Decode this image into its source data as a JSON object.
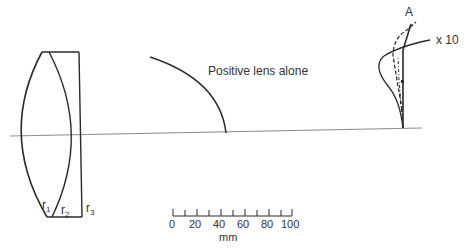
{
  "diagram": {
    "type": "optical lens aberration diagram",
    "lens": {
      "surfaces": [
        {
          "label": "r",
          "sub": "1"
        },
        {
          "label": "r",
          "sub": "2"
        },
        {
          "label": "r",
          "sub": "3"
        }
      ]
    },
    "curve_labels": {
      "positive_lens": "Positive lens alone",
      "point_a": "A",
      "magnification": "x 10"
    },
    "scale_bar": {
      "ticks": [
        "0",
        "20",
        "40",
        "60",
        "80",
        "100"
      ],
      "unit": "mm"
    },
    "colors": {
      "line": "#2a2a2a",
      "axis": "#888888"
    }
  }
}
